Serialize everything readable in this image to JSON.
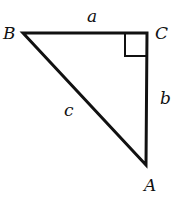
{
  "figure": {
    "type": "right-triangle",
    "vertices": {
      "A": "A",
      "B": "B",
      "C": "C"
    },
    "sides": {
      "a": "a",
      "b": "b",
      "c": "c"
    },
    "right_angle_at": "C",
    "stroke_color": "#111111"
  }
}
